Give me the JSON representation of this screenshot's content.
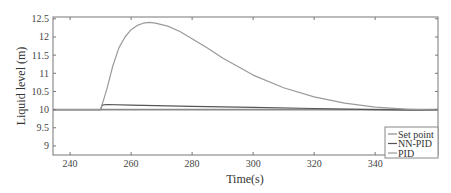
{
  "chart_data": {
    "type": "line",
    "title": "",
    "xlabel": "Time(s)",
    "ylabel": "Liquid level (m)",
    "xlim": [
      234.4,
      360.6
    ],
    "ylim": [
      8.75,
      12.55
    ],
    "xticks": [
      240,
      260,
      280,
      300,
      320,
      340
    ],
    "yticks": [
      9,
      9.5,
      10,
      10.5,
      11,
      11.5,
      12,
      12.5
    ],
    "grid": false,
    "legend_position": "lower right",
    "series": [
      {
        "name": "Set point",
        "color": "#8a8a8a",
        "x": [
          234.4,
          360.6
        ],
        "y": [
          10.0,
          10.0
        ]
      },
      {
        "name": "NN-PID",
        "color": "#555555",
        "x": [
          234.4,
          250,
          250.5,
          252,
          260,
          280,
          300,
          320,
          340,
          360.6
        ],
        "y": [
          10.0,
          10.0,
          10.12,
          10.14,
          10.12,
          10.09,
          10.06,
          10.03,
          10.0,
          9.98
        ]
      },
      {
        "name": "PID",
        "color": "#9a9a9a",
        "x": [
          234.4,
          250,
          252,
          254,
          256,
          258,
          260,
          262,
          264,
          266,
          268,
          272,
          276,
          280,
          285,
          290,
          300,
          310,
          320,
          330,
          340,
          350,
          360.6
        ],
        "y": [
          10.0,
          10.0,
          10.55,
          11.2,
          11.7,
          12.0,
          12.2,
          12.32,
          12.38,
          12.4,
          12.38,
          12.3,
          12.15,
          11.95,
          11.7,
          11.42,
          10.95,
          10.6,
          10.35,
          10.18,
          10.07,
          10.01,
          9.98
        ]
      }
    ]
  },
  "legend": {
    "items": [
      "Set point",
      "NN-PID",
      "PID"
    ]
  },
  "axes": {
    "xlabel": "Time(s)",
    "ylabel": "Liquid level (m)",
    "xtick_labels": [
      "240",
      "260",
      "280",
      "300",
      "320",
      "340"
    ],
    "ytick_labels": [
      "9",
      "9.5",
      "10",
      "10.5",
      "11",
      "11.5",
      "12",
      "12.5"
    ]
  }
}
